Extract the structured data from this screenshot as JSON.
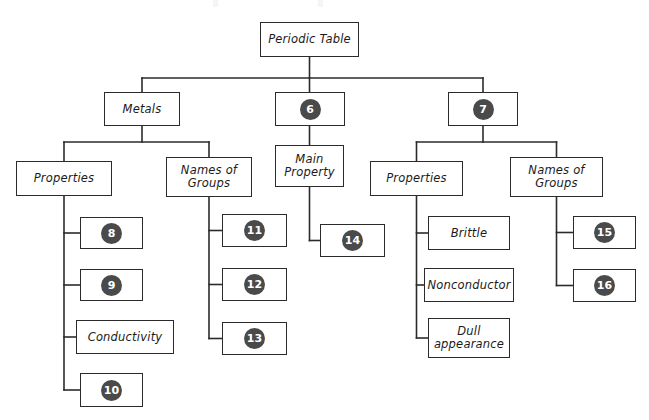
{
  "diagram": {
    "title_node": {
      "label": "Periodic Table"
    },
    "nodes": [
      {
        "id": "periodic-table",
        "label": "Periodic Table",
        "kind": "text",
        "x": 260,
        "y": 22,
        "w": 99,
        "h": 35
      },
      {
        "id": "metals",
        "label": "Metals",
        "kind": "text",
        "x": 104,
        "y": 92,
        "w": 76,
        "h": 34
      },
      {
        "id": "blank-6",
        "label": "6",
        "kind": "number",
        "x": 275,
        "y": 92,
        "w": 70,
        "h": 34
      },
      {
        "id": "blank-7",
        "label": "7",
        "kind": "number",
        "x": 448,
        "y": 92,
        "w": 70,
        "h": 34
      },
      {
        "id": "metals-properties",
        "label": "Properties",
        "kind": "text",
        "x": 16,
        "y": 161,
        "w": 96,
        "h": 35
      },
      {
        "id": "metals-names-of-groups",
        "label": "Names of\nGroups",
        "kind": "text",
        "x": 166,
        "y": 157,
        "w": 86,
        "h": 40
      },
      {
        "id": "main-property",
        "label": "Main\nProperty",
        "kind": "text",
        "x": 275,
        "y": 145,
        "w": 69,
        "h": 42
      },
      {
        "id": "nonmetals-properties",
        "label": "Properties",
        "kind": "text",
        "x": 370,
        "y": 161,
        "w": 93,
        "h": 35
      },
      {
        "id": "nonmetals-names-of-groups",
        "label": "Names of\nGroups",
        "kind": "text",
        "x": 510,
        "y": 157,
        "w": 93,
        "h": 40
      },
      {
        "id": "blank-8",
        "label": "8",
        "kind": "number",
        "x": 80,
        "y": 217,
        "w": 63,
        "h": 32
      },
      {
        "id": "blank-9",
        "label": "9",
        "kind": "number",
        "x": 80,
        "y": 269,
        "w": 63,
        "h": 32
      },
      {
        "id": "conductivity",
        "label": "Conductivity",
        "kind": "text",
        "x": 76,
        "y": 320,
        "w": 98,
        "h": 34
      },
      {
        "id": "blank-10",
        "label": "10",
        "kind": "number",
        "x": 80,
        "y": 373,
        "w": 63,
        "h": 34
      },
      {
        "id": "blank-11",
        "label": "11",
        "kind": "number",
        "x": 222,
        "y": 214,
        "w": 65,
        "h": 33
      },
      {
        "id": "blank-12",
        "label": "12",
        "kind": "number",
        "x": 222,
        "y": 268,
        "w": 65,
        "h": 33
      },
      {
        "id": "blank-13",
        "label": "13",
        "kind": "number",
        "x": 222,
        "y": 322,
        "w": 65,
        "h": 33
      },
      {
        "id": "blank-14",
        "label": "14",
        "kind": "number",
        "x": 320,
        "y": 224,
        "w": 65,
        "h": 33
      },
      {
        "id": "brittle",
        "label": "Brittle",
        "kind": "text",
        "x": 428,
        "y": 216,
        "w": 82,
        "h": 34
      },
      {
        "id": "nonconductor",
        "label": "Nonconductor",
        "kind": "text",
        "x": 424,
        "y": 268,
        "w": 90,
        "h": 34
      },
      {
        "id": "dull-appearance",
        "label": "Dull\nappearance",
        "kind": "text",
        "x": 428,
        "y": 318,
        "w": 82,
        "h": 40
      },
      {
        "id": "blank-15",
        "label": "15",
        "kind": "number",
        "x": 573,
        "y": 216,
        "w": 63,
        "h": 33
      },
      {
        "id": "blank-16",
        "label": "16",
        "kind": "number",
        "x": 573,
        "y": 269,
        "w": 63,
        "h": 33
      }
    ],
    "colors": {
      "badge_fill": "#4a4a4a",
      "badge_text": "#ffffff",
      "box_border": "#2b2b2b",
      "connector": "#2b2b2b",
      "background": "#ffffff"
    }
  }
}
